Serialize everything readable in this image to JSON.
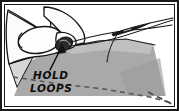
{
  "illustration": {
    "title": "Hand holding thread loops while sewing with needle",
    "caption": {
      "line1": "HOLD",
      "line2": "LOOPS"
    },
    "annotation_arrow": {
      "name": "hold-loops-arrow",
      "points_to": "thread-loops",
      "from_x": 52,
      "from_y": 68,
      "to_x": 62,
      "to_y": 44
    },
    "colors": {
      "background": "#ffffff",
      "ink": "#111111",
      "frame": "#1a1a1a",
      "fabric_main": "#a9a9a9",
      "fabric_light": "#cfcfcf",
      "fabric_shadow": "#8f8f8f",
      "hand_fill": "#fbfbfb",
      "loop_dark": "#2b2b2b",
      "stitch_dash": "#5a5a5a"
    },
    "elements": [
      {
        "name": "hand",
        "label": "Hand"
      },
      {
        "name": "index-finger",
        "label": "Index finger"
      },
      {
        "name": "thumb",
        "label": "Thumb"
      },
      {
        "name": "fabric",
        "label": "Fabric"
      },
      {
        "name": "fabric-fold-edge",
        "label": "Fabric fold edge"
      },
      {
        "name": "needle",
        "label": "Needle"
      },
      {
        "name": "thread",
        "label": "Thread"
      },
      {
        "name": "thread-loops",
        "label": "Thread loops"
      },
      {
        "name": "stitch-line",
        "label": "Dashed stitch line"
      }
    ],
    "frame": {
      "border_width": 2,
      "inner_border_width": 1
    }
  }
}
